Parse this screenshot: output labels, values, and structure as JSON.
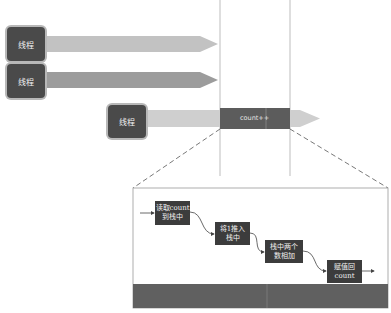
{
  "diagram": {
    "threads": [
      {
        "label": "线程"
      },
      {
        "label": "线程"
      },
      {
        "label": "线程"
      }
    ],
    "critical_section_label": "count++",
    "zoom_steps": [
      {
        "line1": "读取count",
        "line2": "到栈中"
      },
      {
        "line1": "将1推入",
        "line2": "栈中"
      },
      {
        "line1": "栈中两个",
        "line2": "数相加"
      },
      {
        "line1": "赋值回",
        "line2": "count"
      }
    ],
    "colors": {
      "thread_box": "#4a4a4a",
      "arrow_light": "#c8c8c8",
      "arrow_mid": "#9a9a9a",
      "critical": "#5a5a5a",
      "step_box": "#3c3c3c",
      "bottom_bar": "#5f5f5f"
    }
  }
}
